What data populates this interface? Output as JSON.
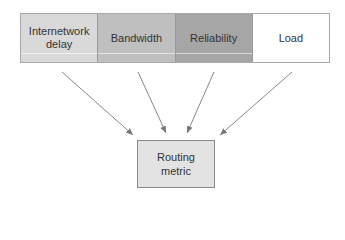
{
  "diagram": {
    "factors": [
      {
        "label": "Internetwork delay",
        "color": "#d9d9d9"
      },
      {
        "label": "Bandwidth",
        "color": "#bfbfbf"
      },
      {
        "label": "Reliability",
        "color": "#a6a6a6"
      },
      {
        "label": "Load",
        "color": "#ffffff"
      }
    ],
    "result": {
      "label": "Routing metric",
      "color": "#e3e3e3"
    },
    "arrow_color": "#777777"
  }
}
